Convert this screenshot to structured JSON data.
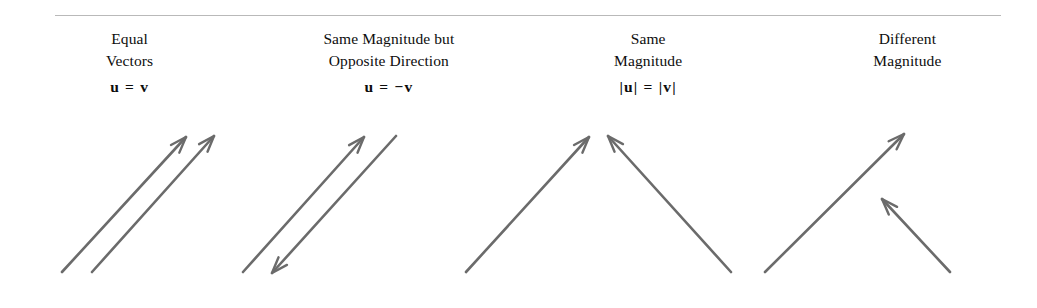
{
  "figure": {
    "background_color": "#ffffff",
    "rule_color": "#b9b9b9",
    "arrow_color": "#6b6b6b",
    "text_color": "#0d0d0d"
  },
  "columns": [
    {
      "title": "Equal\nVectors",
      "formula": "u  =  v",
      "diagram_name": "equal-vectors-diagram",
      "arrows": [
        {
          "name": "vector-u",
          "x1": 62,
          "y1": 272,
          "x2": 186,
          "y2": 137,
          "head": "end"
        },
        {
          "name": "vector-v",
          "x1": 92,
          "y1": 272,
          "x2": 214,
          "y2": 136,
          "head": "end"
        }
      ]
    },
    {
      "title": "Same Magnitude but\nOpposite Direction",
      "formula": "u  =  −v",
      "diagram_name": "opposite-direction-diagram",
      "arrows": [
        {
          "name": "vector-u",
          "x1": 243,
          "y1": 272,
          "x2": 364,
          "y2": 137,
          "head": "end"
        },
        {
          "name": "vector-negative-v",
          "x1": 396,
          "y1": 136,
          "x2": 272,
          "y2": 273,
          "head": "end"
        }
      ]
    },
    {
      "title": "Same\nMagnitude",
      "formula": "|u|  =  |v|",
      "diagram_name": "same-magnitude-diagram",
      "arrows": [
        {
          "name": "vector-u",
          "x1": 466,
          "y1": 272,
          "x2": 589,
          "y2": 137,
          "head": "end"
        },
        {
          "name": "vector-v",
          "x1": 731,
          "y1": 272,
          "x2": 608,
          "y2": 136,
          "head": "end"
        }
      ]
    },
    {
      "title": "Different\nMagnitude",
      "formula": "",
      "diagram_name": "different-magnitude-diagram",
      "arrows": [
        {
          "name": "vector-u",
          "x1": 765,
          "y1": 272,
          "x2": 904,
          "y2": 134,
          "head": "end"
        },
        {
          "name": "vector-v",
          "x1": 950,
          "y1": 272,
          "x2": 882,
          "y2": 199,
          "head": "end"
        }
      ]
    }
  ]
}
